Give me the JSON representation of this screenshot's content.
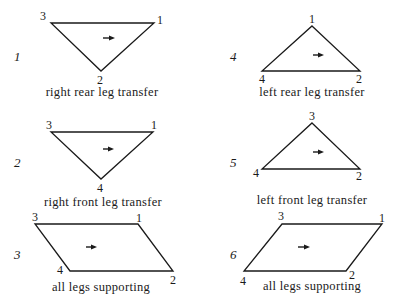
{
  "figure": {
    "colors": {
      "ink": "#1a1a1a",
      "background": "#ffffff"
    },
    "panels": [
      {
        "number": "1",
        "caption": "right rear leg transfer",
        "shape": "triangle",
        "vertices": [
          {
            "label": "3",
            "x": 51,
            "y": 23
          },
          {
            "label": "1",
            "x": 154,
            "y": 23
          },
          {
            "label": "2",
            "x": 101,
            "y": 71
          }
        ],
        "arrow": {
          "x1": 103,
          "x2": 114,
          "y": 38
        }
      },
      {
        "number": "2",
        "caption": "right front leg transfer",
        "shape": "triangle",
        "vertices": [
          {
            "label": "3",
            "x": 51,
            "y": 132
          },
          {
            "label": "1",
            "x": 153,
            "y": 132
          },
          {
            "label": "4",
            "x": 101,
            "y": 179
          }
        ],
        "arrow": {
          "x1": 103,
          "x2": 113,
          "y": 149
        }
      },
      {
        "number": "3",
        "caption": "all legs supporting",
        "shape": "parallelogram",
        "vertices": [
          {
            "label": "3",
            "x": 35,
            "y": 224
          },
          {
            "label": "1",
            "x": 138,
            "y": 224
          },
          {
            "label": "2",
            "x": 173,
            "y": 271
          },
          {
            "label": "4",
            "x": 70,
            "y": 271
          }
        ],
        "arrow": {
          "x1": 86,
          "x2": 97,
          "y": 247
        }
      },
      {
        "number": "4",
        "caption": "left rear leg transfer",
        "shape": "triangle",
        "vertices": [
          {
            "label": "1",
            "x": 312,
            "y": 26
          },
          {
            "label": "2",
            "x": 360,
            "y": 71
          },
          {
            "label": "4",
            "x": 262,
            "y": 71
          }
        ],
        "arrow": {
          "x1": 313,
          "x2": 324,
          "y": 55
        }
      },
      {
        "number": "5",
        "caption": "left front leg transfer",
        "shape": "triangle",
        "vertices": [
          {
            "label": "3",
            "x": 312,
            "y": 123
          },
          {
            "label": "2",
            "x": 360,
            "y": 169
          },
          {
            "label": "4",
            "x": 262,
            "y": 169
          }
        ],
        "arrow": {
          "x1": 313,
          "x2": 324,
          "y": 152
        }
      },
      {
        "number": "6",
        "caption": "all legs supporting",
        "shape": "parallelogram",
        "vertices": [
          {
            "label": "3",
            "x": 282,
            "y": 224
          },
          {
            "label": "1",
            "x": 382,
            "y": 224
          },
          {
            "label": "2",
            "x": 346,
            "y": 271
          },
          {
            "label": "4",
            "x": 244,
            "y": 271
          }
        ],
        "arrow": {
          "x1": 298,
          "x2": 310,
          "y": 247
        }
      }
    ]
  }
}
